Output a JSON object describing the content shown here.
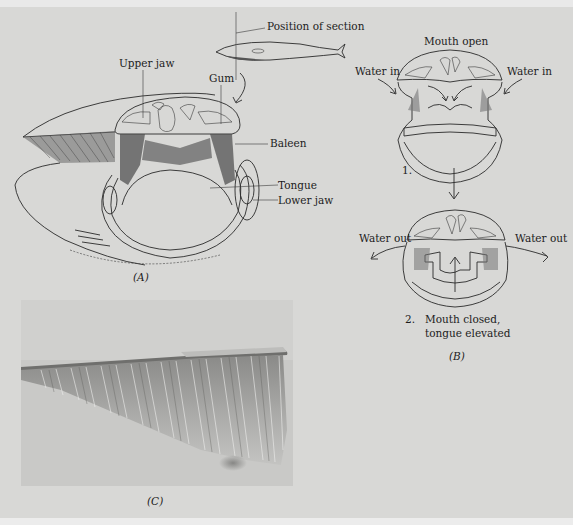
{
  "figure": {
    "panel_a": {
      "caption": "(A)",
      "labels": {
        "position_of_section": "Position of section",
        "upper_jaw": "Upper jaw",
        "gum": "Gum",
        "baleen": "Baleen",
        "tongue": "Tongue",
        "lower_jaw": "Lower jaw"
      }
    },
    "panel_b": {
      "caption": "(B)",
      "step1": {
        "title": "Mouth open",
        "water_in_left": "Water in",
        "water_in_right": "Water in",
        "number": "1."
      },
      "step2": {
        "water_out_left": "Water out",
        "water_out_right": "Water out",
        "number": "2.",
        "line1": "Mouth closed,",
        "line2": "tongue elevated"
      }
    },
    "panel_c": {
      "caption": "(C)",
      "description": "Photograph of baleen plates fringe"
    }
  },
  "colors": {
    "background": "#d8d8d6",
    "ink": "#1c1c1c",
    "photo_bg": "#c8c8c6"
  }
}
